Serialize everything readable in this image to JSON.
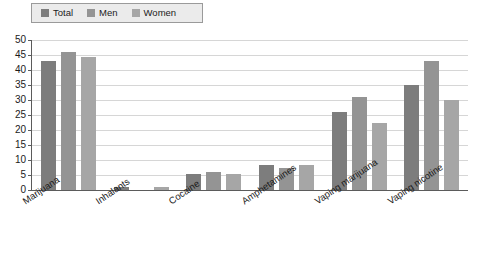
{
  "chart_data": {
    "type": "bar",
    "title": "",
    "subtitle": "",
    "xlabel": "",
    "ylabel": "",
    "ylim": [
      0,
      50
    ],
    "ytick_step": 5,
    "yticks": [
      50,
      45,
      40,
      35,
      30,
      25,
      20,
      15,
      10,
      5,
      0
    ],
    "grid": true,
    "legend_position": "top-left",
    "categories": [
      "Marijuana",
      "Inhalants",
      "Cocaine",
      "Amphetamines",
      "Vaping marijuana",
      "Vaping nicotine"
    ],
    "series": [
      {
        "name": "Total",
        "color": "#7d7d7d",
        "values": [
          43,
          1,
          5.5,
          8.5,
          26,
          35
        ]
      },
      {
        "name": "Men",
        "color": "#949494",
        "values": [
          46,
          0,
          6,
          7.5,
          31,
          43
        ]
      },
      {
        "name": "Women",
        "color": "#a6a6a6",
        "values": [
          44.5,
          1,
          5.5,
          8.5,
          22.5,
          30
        ]
      }
    ]
  },
  "legend": {
    "items": [
      {
        "label": "Total",
        "color": "#7d7d7d"
      },
      {
        "label": "Men",
        "color": "#949494"
      },
      {
        "label": "Women",
        "color": "#a6a6a6"
      }
    ]
  }
}
